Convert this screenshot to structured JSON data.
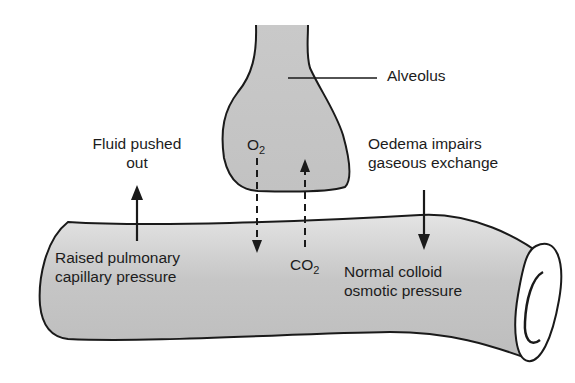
{
  "figure": {
    "type": "diagram",
    "labels": {
      "alveolus": "Alveolus",
      "fluid_line1": "Fluid pushed",
      "fluid_line2": "out",
      "oedema_line1": "Oedema impairs",
      "oedema_line2": "gaseous exchange",
      "raised_line1": "Raised pulmonary",
      "raised_line2": "capillary pressure",
      "normal_line1": "Normal colloid",
      "normal_line2": "osmotic pressure",
      "o2_main": "O",
      "o2_sub": "2",
      "co2_main": "CO",
      "co2_sub": "2"
    },
    "arrows": [
      {
        "name": "fluid-out-arrow",
        "direction": "up",
        "style": "solid"
      },
      {
        "name": "oedema-arrow",
        "direction": "down",
        "style": "solid"
      },
      {
        "name": "o2-arrow",
        "direction": "down",
        "style": "dashed"
      },
      {
        "name": "co2-arrow",
        "direction": "up",
        "style": "dashed"
      }
    ],
    "colors": {
      "fill": "#c4c4c4",
      "stroke": "#1a1a1a",
      "background": "#ffffff"
    }
  }
}
